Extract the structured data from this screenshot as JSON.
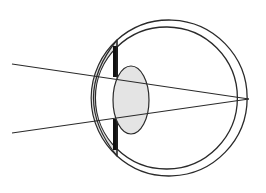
{
  "diagram": {
    "colors": {
      "stroke": "#2a2a2a",
      "cornea_fill": "#e2e2e2",
      "lens_fill": "#e4e4e4",
      "iris_fill": "#111111",
      "background": "#ffffff"
    },
    "eyeball": {
      "cx": 180,
      "cy": 98,
      "outer_r": 78,
      "inner_r": 71
    },
    "lens": {
      "cx": 131,
      "cy": 100,
      "rx": 18,
      "ry": 34
    },
    "rays": [
      {
        "x1": 12,
        "y1": 64,
        "x2": 249,
        "y2": 99
      },
      {
        "x1": 12,
        "y1": 133,
        "x2": 249,
        "y2": 99
      }
    ],
    "focal_point": {
      "x": 249,
      "y": 99
    }
  }
}
